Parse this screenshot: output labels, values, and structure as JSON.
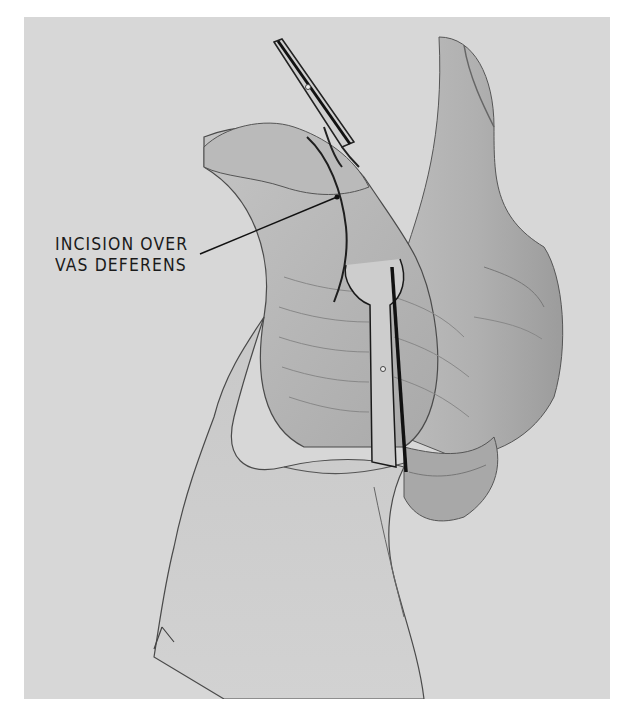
{
  "figure": {
    "type": "surgical illustration",
    "background_color": "#d7d7d7",
    "annotations": [
      {
        "lines": [
          "INCISION OVER",
          "VAS DEFERENS"
        ],
        "leader_target": "incision line on scrotal skin"
      }
    ],
    "elements": [
      "hand holding scrotum",
      "upper forceps",
      "lower ring forceps",
      "incision line",
      "penis shaft",
      "skin folds"
    ]
  }
}
